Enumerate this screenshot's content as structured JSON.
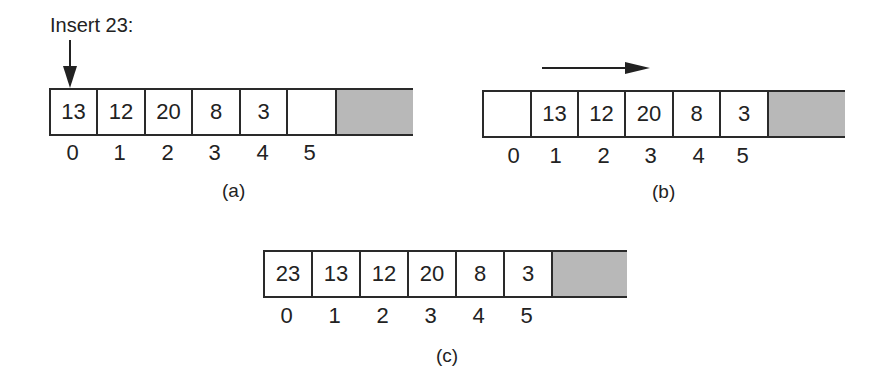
{
  "figure": {
    "title": "Insert 23:",
    "panels": [
      {
        "id": "a",
        "caption": "(a)",
        "cells": [
          "13",
          "12",
          "20",
          "8",
          "3",
          ""
        ],
        "indices": [
          "0",
          "1",
          "2",
          "3",
          "4",
          "5"
        ],
        "annotation": "down-arrow at index 0"
      },
      {
        "id": "b",
        "caption": "(b)",
        "cells": [
          "",
          "13",
          "12",
          "20",
          "8",
          "3"
        ],
        "indices": [
          "0",
          "1",
          "2",
          "3",
          "4",
          "5"
        ],
        "annotation": "right-arrow indicating shift"
      },
      {
        "id": "c",
        "caption": "(c)",
        "cells": [
          "23",
          "13",
          "12",
          "20",
          "8",
          "3"
        ],
        "indices": [
          "0",
          "1",
          "2",
          "3",
          "4",
          "5"
        ]
      }
    ],
    "colors": {
      "unused": "#b8b8b8",
      "border": "#2a2a2a"
    }
  }
}
